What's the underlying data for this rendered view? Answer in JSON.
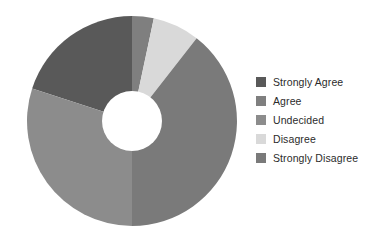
{
  "chart_data": {
    "type": "pie",
    "variant": "donut",
    "title": "",
    "subtitle": "",
    "xlabel": "",
    "ylabel": "",
    "legend_position": "right",
    "grid": false,
    "inner_radius_ratio": 0.29,
    "start_angle_deg": 0,
    "direction": "clockwise",
    "categories": [
      "Strongly Agree",
      "Agree",
      "Undecided",
      "Disagree",
      "Strongly Disagree"
    ],
    "values": [
      20,
      24,
      40,
      7,
      9
    ],
    "percentages": [
      "20%",
      "24%",
      "40%",
      "7%",
      "9%"
    ],
    "colors": [
      "#595959",
      "#7f7f7f",
      "#8c8c8c",
      "#d9d9d9",
      "#7a7a7a"
    ],
    "slices": [
      {
        "label": "Strongly Agree",
        "value": 20,
        "percent": "20%",
        "color": "#595959",
        "start_angle_deg": 288,
        "end_angle_deg": 360
      },
      {
        "label": "Agree",
        "value": 24,
        "percent": "24%",
        "color": "#7f7f7f",
        "start_angle_deg": 0,
        "end_angle_deg": 12
      },
      {
        "label": "Undecided",
        "value": 40,
        "percent": "40%",
        "color": "#8c8c8c",
        "start_angle_deg": 180,
        "end_angle_deg": 288
      },
      {
        "label": "Disagree",
        "value": 7,
        "percent": "7%",
        "color": "#d9d9d9",
        "start_angle_deg": 12,
        "end_angle_deg": 38
      },
      {
        "label": "Strongly Disagree",
        "value": 9,
        "percent": "9%",
        "color": "#7a7a7a",
        "start_angle_deg": 38,
        "end_angle_deg": 180
      }
    ]
  },
  "legend": {
    "items": [
      {
        "label": "Strongly Agree",
        "color": "#595959"
      },
      {
        "label": "Agree",
        "color": "#7f7f7f"
      },
      {
        "label": "Undecided",
        "color": "#8c8c8c"
      },
      {
        "label": "Disagree",
        "color": "#d9d9d9"
      },
      {
        "label": "Strongly Disagree",
        "color": "#7a7a7a"
      }
    ]
  },
  "geometry": {
    "center_x": 132,
    "center_y": 121,
    "outer_radius": 105,
    "inner_radius": 30
  },
  "style": {
    "background": "#ffffff",
    "label_color": "#2b2b2b"
  }
}
